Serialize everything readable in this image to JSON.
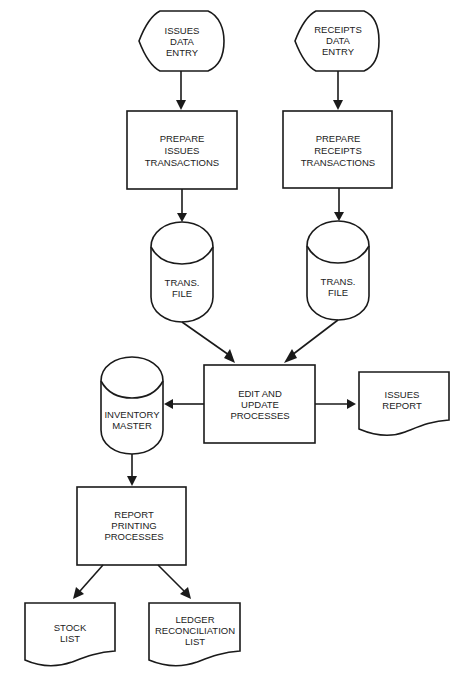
{
  "diagram": {
    "type": "system flowchart",
    "nodes": {
      "issues_entry": {
        "shape": "display",
        "lines": [
          "ISSUES",
          "DATA",
          "ENTRY"
        ]
      },
      "receipts_entry": {
        "shape": "display",
        "lines": [
          "RECEIPTS",
          "DATA",
          "ENTRY"
        ]
      },
      "prepare_issues": {
        "shape": "process",
        "lines": [
          "PREPARE",
          "ISSUES",
          "TRANSACTIONS"
        ]
      },
      "prepare_receipts": {
        "shape": "process",
        "lines": [
          "PREPARE",
          "RECEIPTS",
          "TRANSACTIONS"
        ]
      },
      "trans_file_left": {
        "shape": "storage",
        "lines": [
          "TRANS.",
          "FILE"
        ]
      },
      "trans_file_right": {
        "shape": "storage",
        "lines": [
          "TRANS.",
          "FILE"
        ]
      },
      "edit_update": {
        "shape": "process",
        "lines": [
          "EDIT AND",
          "UPDATE",
          "PROCESSES"
        ]
      },
      "inventory_master": {
        "shape": "storage",
        "lines": [
          "INVENTORY",
          "MASTER"
        ]
      },
      "issues_report": {
        "shape": "document",
        "lines": [
          "ISSUES",
          "REPORT"
        ]
      },
      "report_printing": {
        "shape": "process",
        "lines": [
          "REPORT",
          "PRINTING",
          "PROCESSES"
        ]
      },
      "stock_list": {
        "shape": "document",
        "lines": [
          "STOCK",
          "LIST"
        ]
      },
      "ledger_list": {
        "shape": "document",
        "lines": [
          "LEDGER",
          "RECONCILIATION",
          "LIST"
        ]
      }
    },
    "edges": [
      {
        "from": "issues_entry",
        "to": "prepare_issues"
      },
      {
        "from": "receipts_entry",
        "to": "prepare_receipts"
      },
      {
        "from": "prepare_issues",
        "to": "trans_file_left"
      },
      {
        "from": "prepare_receipts",
        "to": "trans_file_right"
      },
      {
        "from": "trans_file_left",
        "to": "edit_update"
      },
      {
        "from": "trans_file_right",
        "to": "edit_update"
      },
      {
        "from": "edit_update",
        "to": "inventory_master"
      },
      {
        "from": "edit_update",
        "to": "issues_report"
      },
      {
        "from": "inventory_master",
        "to": "report_printing"
      },
      {
        "from": "report_printing",
        "to": "stock_list"
      },
      {
        "from": "report_printing",
        "to": "ledger_list"
      }
    ]
  }
}
